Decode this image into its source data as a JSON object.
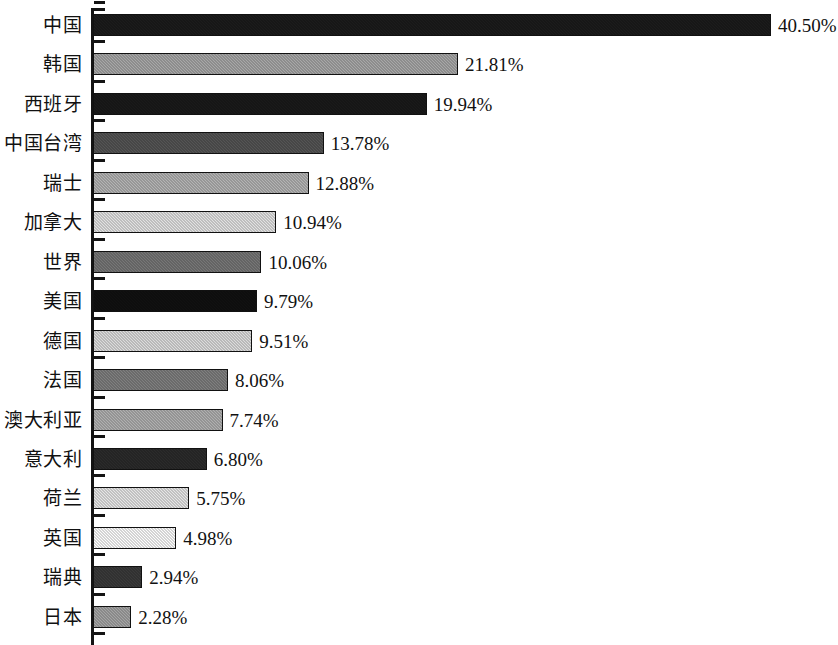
{
  "chart_data": {
    "type": "bar",
    "orientation": "horizontal",
    "title": "",
    "subtitle": "",
    "xlabel": "",
    "ylabel": "",
    "grid": false,
    "legend": null,
    "axis": {
      "value_min": 0,
      "value_max": 40.5,
      "units": "%",
      "tick_labels_shown": false,
      "category_axis_position": "left",
      "category_ticks_between_bars": true
    },
    "value_label_suffix": "%",
    "categories": [
      "中国",
      "韩国",
      "西班牙",
      "中国台湾",
      "瑞士",
      "加拿大",
      "世界",
      "美国",
      "德国",
      "法国",
      "澳大利亚",
      "意大利",
      "荷兰",
      "英国",
      "瑞典",
      "日本"
    ],
    "values": [
      40.5,
      21.81,
      19.94,
      13.78,
      12.88,
      10.94,
      10.06,
      9.79,
      9.51,
      8.06,
      7.74,
      6.8,
      5.75,
      4.98,
      2.94,
      2.28
    ],
    "value_labels": [
      "40.50%",
      "21.81%",
      "19.94%",
      "13.78%",
      "12.88%",
      "10.94%",
      "10.06%",
      "9.79%",
      "9.51%",
      "8.06%",
      "7.74%",
      "6.80%",
      "5.75%",
      "4.98%",
      "2.94%",
      "2.28%"
    ],
    "bar_colors": [
      "#1c1c1c",
      "#a8a8a8",
      "#1a1a1a",
      "#555555",
      "#b4b4b4",
      "#e2e2e2",
      "#777777",
      "#111111",
      "#dcdcdc",
      "#808080",
      "#b0b0b0",
      "#2b2b2b",
      "#e6e6e6",
      "#fdfdfd",
      "#3a3a3a",
      "#a5a5a5"
    ],
    "bar_outline_color": "#111111",
    "axis_color": "#141414",
    "background_color": "#ffffff"
  }
}
